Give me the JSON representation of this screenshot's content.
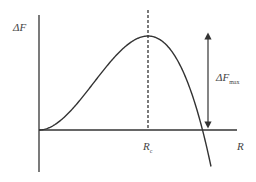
{
  "diagram": {
    "type": "free-energy-vs-radius curve",
    "y_axis_label": "ΔF",
    "x_axis_label": "R",
    "critical_radius_label": {
      "main": "R",
      "sub": "c"
    },
    "barrier_label": {
      "main": "ΔF",
      "sub": "max"
    },
    "curve": {
      "description": "Free energy rises from origin to a maximum at critical radius R_c, then decreases, crossing zero and becoming negative",
      "form": "aR^2 - bR^3"
    },
    "colors": {
      "line": "#333333",
      "background": "#ffffff"
    }
  }
}
